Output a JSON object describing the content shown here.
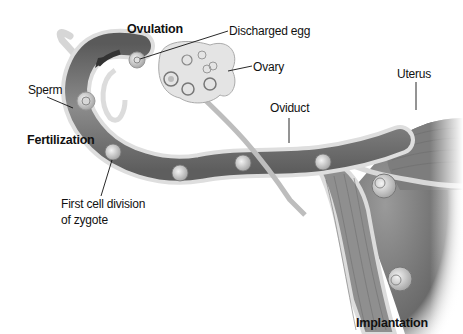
{
  "diagram": {
    "type": "anatomical illustration",
    "labels": {
      "ovulation": "Ovulation",
      "discharged_egg": "Discharged egg",
      "ovary": "Ovary",
      "uterus": "Uterus",
      "sperm": "Sperm",
      "oviduct": "Oviduct",
      "fertilization": "Fertilization",
      "first_cell_division_line1": "First cell division",
      "first_cell_division_line2": "of zygote",
      "implantation": "Implantation"
    },
    "colors": {
      "background": "#ffffff",
      "tube_wall": "#d9d9d9",
      "tube_lumen": "#6f6f6f",
      "ovary": "#e2e2e2",
      "uterus": "#8a8a8a",
      "text": "#111111"
    }
  }
}
